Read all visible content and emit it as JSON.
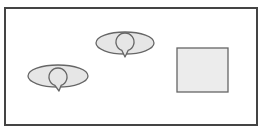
{
  "diagram": {
    "frame": {
      "x": 5,
      "y": 8,
      "width": 252,
      "height": 117,
      "stroke": "#444444",
      "stroke_width": 2,
      "fill": "#ffffff"
    },
    "shapes": [
      {
        "type": "eye",
        "name": "eye-shape-upper",
        "ellipse": {
          "cx": 125,
          "cy": 43,
          "rx": 29,
          "ry": 11
        },
        "circle": {
          "cx": 125,
          "cy": 42,
          "r": 9
        },
        "tail_tip": {
          "x": 125,
          "y": 57
        },
        "fill": "#e6e6e6",
        "stroke": "#666666"
      },
      {
        "type": "eye",
        "name": "eye-shape-lower",
        "ellipse": {
          "cx": 58,
          "cy": 76,
          "rx": 30,
          "ry": 11
        },
        "circle": {
          "cx": 58,
          "cy": 77,
          "r": 9
        },
        "tail_tip": {
          "x": 59,
          "y": 91
        },
        "fill": "#e6e6e6",
        "stroke": "#666666"
      },
      {
        "type": "rect",
        "name": "square-shape",
        "x": 177,
        "y": 48,
        "width": 51,
        "height": 44,
        "fill": "#ececec",
        "stroke": "#666666"
      }
    ]
  }
}
